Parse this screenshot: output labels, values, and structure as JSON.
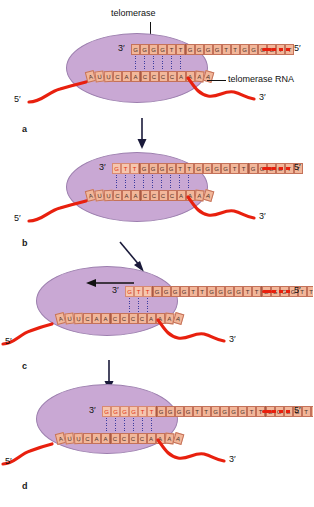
{
  "figure": {
    "title_label": "telomerase",
    "rna_label": "telomerase RNA",
    "end_5": "5′",
    "end_3": "3′"
  },
  "panels": [
    {
      "letter": "a",
      "dna_segments": [
        {
          "bases": "GGGGTT",
          "new": false
        },
        {
          "bases": "GGGGTT",
          "new": false
        },
        {
          "bases": "GGGGTT",
          "new": false
        }
      ],
      "rna_template": "AUUCAACCCCAAAA",
      "left_end": "5′",
      "right_end": "3′",
      "dna_3_label": "3′",
      "dna_5_label": "5′",
      "pair_count": 6,
      "has_translocation_arrow": false
    },
    {
      "letter": "b",
      "dna_segments": [
        {
          "bases": "GTT",
          "new": true
        },
        {
          "bases": "GGGGTT",
          "new": false
        },
        {
          "bases": "GGGGTT",
          "new": false
        },
        {
          "bases": "GGGGTT",
          "new": false
        }
      ],
      "rna_template": "AUUCAACCCCAAAA",
      "left_end": "5′",
      "right_end": "3′",
      "dna_3_label": "3′",
      "dna_5_label": "5′",
      "pair_count": 9,
      "has_translocation_arrow": false
    },
    {
      "letter": "c",
      "dna_segments": [
        {
          "bases": "GTT",
          "new": true
        },
        {
          "bases": "GGGGTT",
          "new": false
        },
        {
          "bases": "GGGGTT",
          "new": false
        },
        {
          "bases": "GGGGTT",
          "new": false
        }
      ],
      "rna_template": "AUUCAACCCCAAAA",
      "left_end": "5′",
      "right_end": "3′",
      "dna_3_label": "3′",
      "dna_5_label": "5′",
      "pair_count": 3,
      "has_translocation_arrow": true
    },
    {
      "letter": "d",
      "dna_segments": [
        {
          "bases": "GGGGTT",
          "new": true
        },
        {
          "bases": "GGGGTT",
          "new": false
        },
        {
          "bases": "GGGGTT",
          "new": false
        },
        {
          "bases": "GGGGTT",
          "new": false
        }
      ],
      "rna_template": "AUUCAACCCCAAAA",
      "left_end": "5′",
      "right_end": "3′",
      "dna_3_label": "3′",
      "dna_5_label": "5′",
      "pair_count": 6,
      "has_translocation_arrow": false
    }
  ],
  "colors": {
    "enzyme": "#c9a8d4",
    "nucleotide": "#f2b79a",
    "new_nucleotide_text": "#e03010",
    "dna_backbone": "#e8200e",
    "base_pair": "#3b3b9e"
  }
}
